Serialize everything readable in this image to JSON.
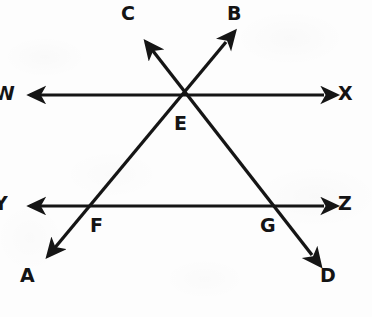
{
  "figure": {
    "stroke_color": "#151515",
    "background_color": "#fdfdfd",
    "width": 372,
    "height": 317
  },
  "labels": {
    "W": "W",
    "X": "X",
    "Y": "Y",
    "Z": "Z",
    "A": "A",
    "B": "B",
    "C": "C",
    "D": "D",
    "E": "E",
    "F": "F",
    "G": "G"
  },
  "label_positions": {
    "W": {
      "x": -6,
      "y": 84
    },
    "X": {
      "x": 338,
      "y": 84
    },
    "Y": {
      "x": -6,
      "y": 194
    },
    "Z": {
      "x": 338,
      "y": 194
    },
    "A": {
      "x": 20,
      "y": 266
    },
    "B": {
      "x": 227,
      "y": 4
    },
    "C": {
      "x": 121,
      "y": 4
    },
    "D": {
      "x": 320,
      "y": 266
    },
    "E": {
      "x": 174,
      "y": 114
    },
    "F": {
      "x": 90,
      "y": 216
    },
    "G": {
      "x": 260,
      "y": 216
    }
  },
  "lines": [
    {
      "name": "line-WX",
      "kind": "double-arrow-horizontal",
      "from_label": "W",
      "to_label": "X",
      "x1": 24,
      "y1": 95,
      "x2": 330,
      "y2": 95
    },
    {
      "name": "line-YZ",
      "kind": "double-arrow-horizontal",
      "from_label": "Y",
      "to_label": "Z",
      "x1": 24,
      "y1": 206,
      "x2": 330,
      "y2": 206
    },
    {
      "name": "line-AB",
      "kind": "double-arrow-transversal",
      "from_label": "A",
      "to_label": "B",
      "x1": 42,
      "y1": 263,
      "x2": 232,
      "y2": 35
    },
    {
      "name": "line-CD",
      "kind": "double-arrow-transversal",
      "from_label": "C",
      "to_label": "D",
      "x1": 140,
      "y1": 35,
      "x2": 318,
      "y2": 262
    }
  ],
  "intersections": [
    {
      "name": "point-E",
      "label": "E",
      "x": 185,
      "y": 95,
      "of": "line-AB and line-CD on line-WX"
    },
    {
      "name": "point-F",
      "label": "F",
      "x": 93,
      "y": 206,
      "of": "line-AB on line-YZ"
    },
    {
      "name": "point-G",
      "label": "G",
      "x": 272,
      "y": 206,
      "of": "line-CD on line-YZ"
    }
  ]
}
